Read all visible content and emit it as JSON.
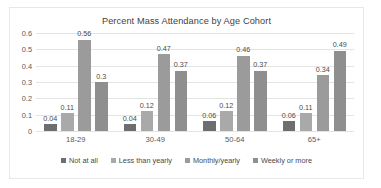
{
  "chart_data": {
    "type": "bar",
    "title": "Percent Mass Attendance by Age Cohort",
    "xlabel": "",
    "ylabel": "",
    "categories": [
      "18-29",
      "30-49",
      "50-64",
      "65+"
    ],
    "yticks": [
      "0.6",
      "0.5",
      "0.4",
      "0.3",
      "0.2",
      "0.1",
      "0"
    ],
    "ylim": [
      0,
      0.6
    ],
    "grid": true,
    "legend_position": "bottom",
    "series": [
      {
        "name": "Not at all",
        "color": "#6e6e6e",
        "values": [
          0.04,
          0.04,
          0.06,
          0.06
        ],
        "labels": [
          "0.04",
          "0.04",
          "0.06",
          "0.06"
        ]
      },
      {
        "name": "Less than yearly",
        "color": "#a9a9a9",
        "values": [
          0.11,
          0.12,
          0.12,
          0.11
        ],
        "labels": [
          "0.11",
          "0.12",
          "0.12",
          "0.11"
        ]
      },
      {
        "name": "Monthly/yearly",
        "color": "#9b9b9b",
        "values": [
          0.56,
          0.47,
          0.46,
          0.34
        ],
        "labels": [
          "0.56",
          "0.47",
          "0.46",
          "0.34"
        ]
      },
      {
        "name": "Weekly or more",
        "color": "#8f8f8f",
        "values": [
          0.3,
          0.37,
          0.37,
          0.49
        ],
        "labels": [
          "0.3",
          "0.37",
          "0.37",
          "0.49"
        ]
      }
    ]
  }
}
